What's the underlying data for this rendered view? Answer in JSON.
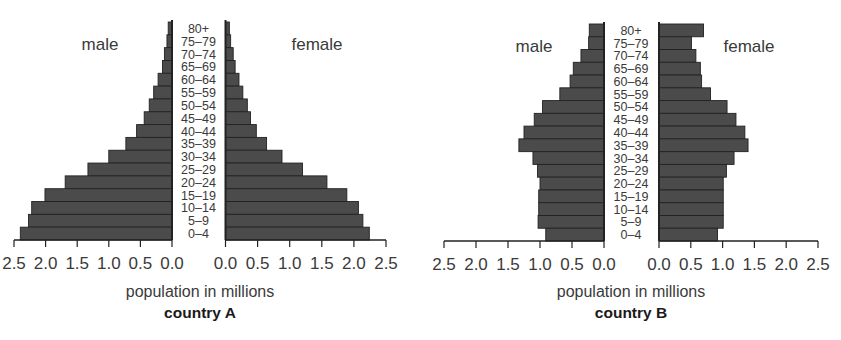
{
  "chart_data": [
    {
      "type": "bar",
      "subtype": "population-pyramid",
      "title": "country A",
      "xlabel": "population in millions",
      "xlim": [
        0,
        2.5
      ],
      "x_ticks": [
        "0.0",
        "0.5",
        "1.0",
        "1.5",
        "2.0",
        "2.5"
      ],
      "categories": [
        "80+",
        "75–79",
        "70–74",
        "65–69",
        "60–64",
        "55–59",
        "50–54",
        "45–49",
        "40–44",
        "35–39",
        "30–34",
        "25–29",
        "20–24",
        "15–19",
        "10–14",
        "5–9",
        "0–4"
      ],
      "series": [
        {
          "name": "male",
          "values": [
            0.06,
            0.08,
            0.12,
            0.15,
            0.22,
            0.29,
            0.36,
            0.44,
            0.56,
            0.73,
            1.0,
            1.33,
            1.69,
            2.01,
            2.22,
            2.27,
            2.4
          ]
        },
        {
          "name": "female",
          "values": [
            0.06,
            0.08,
            0.12,
            0.15,
            0.21,
            0.27,
            0.34,
            0.39,
            0.48,
            0.64,
            0.88,
            1.2,
            1.58,
            1.89,
            2.07,
            2.14,
            2.24
          ]
        }
      ],
      "grid": false
    },
    {
      "type": "bar",
      "subtype": "population-pyramid",
      "title": "country B",
      "xlabel": "population in millions",
      "xlim": [
        0,
        2.5
      ],
      "x_ticks": [
        "0.0",
        "0.5",
        "1.0",
        "1.5",
        "2.0",
        "2.5"
      ],
      "categories": [
        "80+",
        "75–79",
        "70–74",
        "65–69",
        "60–64",
        "55–59",
        "50–54",
        "45–49",
        "40–44",
        "35–39",
        "30–34",
        "25–29",
        "20–24",
        "15–19",
        "10–14",
        "5–9",
        "0–4"
      ],
      "series": [
        {
          "name": "male",
          "values": [
            0.23,
            0.24,
            0.36,
            0.48,
            0.53,
            0.69,
            0.96,
            1.09,
            1.25,
            1.33,
            1.11,
            1.04,
            1.0,
            1.02,
            1.02,
            1.03,
            0.91
          ]
        },
        {
          "name": "female",
          "values": [
            0.7,
            0.51,
            0.58,
            0.65,
            0.67,
            0.81,
            1.07,
            1.21,
            1.35,
            1.4,
            1.18,
            1.06,
            1.01,
            1.01,
            1.01,
            1.01,
            0.92
          ]
        }
      ],
      "grid": false
    }
  ],
  "colors": {
    "bar_fill": "#4b4b4b",
    "bar_edge": "#222222",
    "axis": "#222222",
    "text": "#3a3a3a"
  }
}
